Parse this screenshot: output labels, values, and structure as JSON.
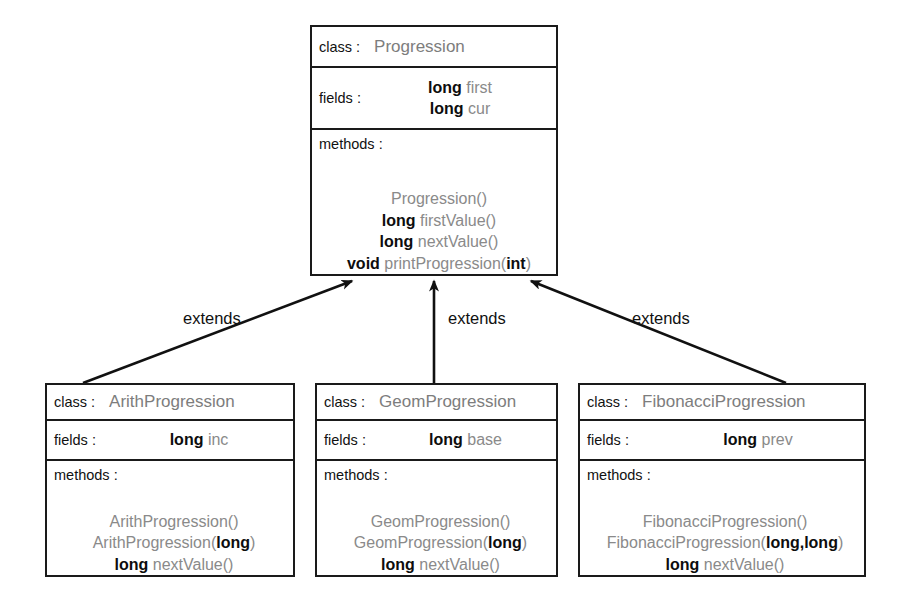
{
  "diagram": {
    "type": "uml-class-diagram",
    "labels": {
      "class": "class :",
      "fields": "fields :",
      "methods": "methods :"
    },
    "relationship_label": "extends"
  },
  "classes": {
    "progression": {
      "name": "Progression",
      "fields": [
        {
          "type": "long",
          "name": "first"
        },
        {
          "type": "long",
          "name": "cur"
        }
      ],
      "methods": [
        {
          "type": "",
          "name": "Progression()"
        },
        {
          "type": "long",
          "name": "firstValue()"
        },
        {
          "type": "long",
          "name": "nextValue()"
        },
        {
          "type": "void",
          "name": "printProgression(",
          "param": "int",
          "close": ")"
        }
      ]
    },
    "arith": {
      "name": "ArithProgression",
      "fields": [
        {
          "type": "long",
          "name": "inc"
        }
      ],
      "methods": [
        {
          "type": "",
          "name": "ArithProgression()"
        },
        {
          "type": "",
          "name": "ArithProgression(",
          "param": "long",
          "close": ")"
        },
        {
          "type": "long",
          "name": "nextValue()"
        }
      ]
    },
    "geom": {
      "name": "GeomProgression",
      "fields": [
        {
          "type": "long",
          "name": "base"
        }
      ],
      "methods": [
        {
          "type": "",
          "name": "GeomProgression()"
        },
        {
          "type": "",
          "name": "GeomProgression(",
          "param": "long",
          "close": ")"
        },
        {
          "type": "long",
          "name": "nextValue()"
        }
      ]
    },
    "fibonacci": {
      "name": "FibonacciProgression",
      "fields": [
        {
          "type": "long",
          "name": "prev"
        }
      ],
      "methods": [
        {
          "type": "",
          "name": "FibonacciProgression()"
        },
        {
          "type": "",
          "name": "FibonacciProgression(",
          "param": "long,long",
          "close": ")"
        },
        {
          "type": "long",
          "name": "nextValue()"
        }
      ]
    }
  },
  "edges": [
    {
      "id": "arith-extends",
      "label": "extends",
      "from": "ArithProgression",
      "to": "Progression"
    },
    {
      "id": "geom-extends",
      "label": "extends",
      "from": "GeomProgression",
      "to": "Progression"
    },
    {
      "id": "fibonacci-extends",
      "label": "extends",
      "from": "FibonacciProgression",
      "to": "Progression"
    }
  ],
  "colors": {
    "border": "#1a1a1a",
    "label_text": "#111111",
    "member_name": "#8a8a8a",
    "member_type": "#0d0d0d",
    "background": "#ffffff"
  }
}
